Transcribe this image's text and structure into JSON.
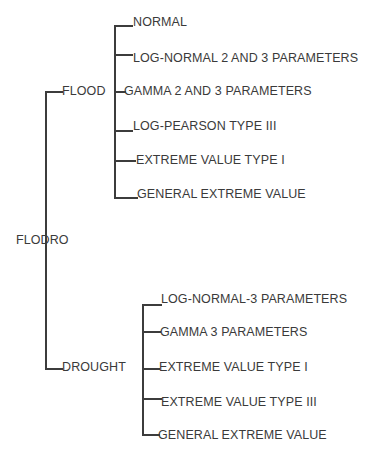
{
  "diagram": {
    "type": "tree",
    "root": {
      "label": "FLODRO",
      "children": [
        {
          "label": "FLOOD",
          "children": [
            {
              "label": "NORMAL"
            },
            {
              "label": "LOG-NORMAL 2 AND 3 PARAMETERS"
            },
            {
              "label": "GAMMA 2 AND 3 PARAMETERS"
            },
            {
              "label": "LOG-PEARSON TYPE III"
            },
            {
              "label": "EXTREME VALUE TYPE I"
            },
            {
              "label": "GENERAL EXTREME VALUE"
            }
          ]
        },
        {
          "label": "DROUGHT",
          "children": [
            {
              "label": "LOG-NORMAL-3 PARAMETERS"
            },
            {
              "label": "GAMMA 3 PARAMETERS"
            },
            {
              "label": "EXTREME VALUE TYPE I"
            },
            {
              "label": "EXTREME VALUE TYPE III"
            },
            {
              "label": "GENERAL EXTREME VALUE"
            }
          ]
        }
      ]
    },
    "line_color": "#3c3c3c",
    "text_color": "#3a3a3a"
  }
}
